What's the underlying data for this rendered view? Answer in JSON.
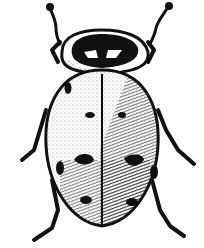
{
  "image": {
    "subject": "ladybug beetle pen-and-ink illustration",
    "view": "dorsal",
    "colors": {
      "ink": "#111111",
      "paper": "#ffffff"
    },
    "elytra_spots": 8
  }
}
